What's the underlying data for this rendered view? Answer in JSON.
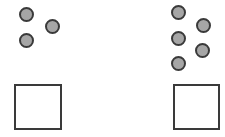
{
  "diagram": {
    "colors": {
      "circle_fill": "#a6a6a6",
      "stroke": "#3a3a3a",
      "background": "#ffffff"
    },
    "groups": [
      {
        "name": "left",
        "circle_count": 3,
        "circles": [
          {
            "cx": 26,
            "cy": 14
          },
          {
            "cx": 52,
            "cy": 26
          },
          {
            "cx": 26,
            "cy": 40
          }
        ],
        "square": {
          "x": 14,
          "y": 84,
          "w": 48,
          "h": 46
        }
      },
      {
        "name": "right",
        "circle_count": 5,
        "circles": [
          {
            "cx": 178,
            "cy": 12
          },
          {
            "cx": 203,
            "cy": 25
          },
          {
            "cx": 178,
            "cy": 38
          },
          {
            "cx": 202,
            "cy": 50
          },
          {
            "cx": 178,
            "cy": 63
          }
        ],
        "square": {
          "x": 173,
          "y": 84,
          "w": 47,
          "h": 46
        }
      }
    ]
  }
}
